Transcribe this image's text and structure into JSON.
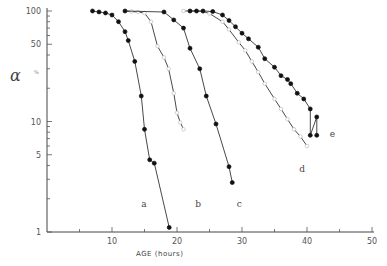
{
  "chart_data": {
    "type": "line",
    "title": "",
    "xlabel": "AGE (hours)",
    "ylabel": "α %",
    "y_scale": "log",
    "xlim": [
      0,
      50
    ],
    "ylim": [
      1,
      100
    ],
    "x_ticks": [
      10,
      20,
      30,
      40,
      50
    ],
    "y_tick_labels": [
      "1",
      "5",
      "10",
      "50",
      "100"
    ],
    "y_ticks": [
      1,
      5,
      10,
      50,
      100
    ],
    "grid": false,
    "legend": "none (curves labelled inline a–e)",
    "series": [
      {
        "name": "a",
        "marker": "filled-circle",
        "points": [
          [
            7,
            100
          ],
          [
            8,
            98
          ],
          [
            9,
            96
          ],
          [
            10,
            92
          ],
          [
            11,
            80
          ],
          [
            12,
            65
          ],
          [
            12.5,
            54
          ],
          [
            13.5,
            35
          ],
          [
            14.5,
            17
          ],
          [
            15,
            8.5
          ],
          [
            15.8,
            4.5
          ],
          [
            16.5,
            4.2
          ],
          [
            18.8,
            1.1
          ]
        ],
        "label_pos": [
          14.5,
          1.7
        ]
      },
      {
        "name": "b",
        "marker": "open-circle",
        "points": [
          [
            12,
            100
          ],
          [
            13,
            99
          ],
          [
            14,
            98
          ],
          [
            15,
            96
          ],
          [
            16,
            80
          ],
          [
            17,
            48
          ],
          [
            18,
            38
          ],
          [
            18.7,
            30
          ],
          [
            19.5,
            18
          ],
          [
            20,
            12
          ],
          [
            20.5,
            9.8
          ],
          [
            21,
            8.5
          ]
        ],
        "label_pos": [
          22.8,
          1.7
        ]
      },
      {
        "name": "c",
        "marker": "filled-circle",
        "points": [
          [
            12,
            100
          ],
          [
            18,
            98
          ],
          [
            19.5,
            83
          ],
          [
            21,
            70
          ],
          [
            22,
            46
          ],
          [
            23.5,
            30
          ],
          [
            24.5,
            17
          ],
          [
            26,
            9.5
          ],
          [
            28,
            3.9
          ],
          [
            28.5,
            2.8
          ]
        ],
        "label_pos": [
          29.2,
          1.7
        ]
      },
      {
        "name": "d",
        "marker": "open-circle",
        "points": [
          [
            21,
            100
          ],
          [
            22,
            100
          ],
          [
            23,
            100
          ],
          [
            24,
            99
          ],
          [
            25,
            95
          ],
          [
            27,
            80
          ],
          [
            28,
            68
          ],
          [
            29.5,
            52
          ],
          [
            30.5,
            44
          ],
          [
            31.5,
            35
          ],
          [
            32.5,
            28
          ],
          [
            33.5,
            22
          ],
          [
            35,
            16
          ],
          [
            36,
            13
          ],
          [
            37,
            10.5
          ],
          [
            38,
            8.5
          ],
          [
            39,
            7.3
          ],
          [
            40,
            6
          ]
        ],
        "label_pos": [
          38.8,
          3.5
        ]
      },
      {
        "name": "e",
        "marker": "filled-circle",
        "points": [
          [
            22,
            100
          ],
          [
            23,
            100
          ],
          [
            24,
            100
          ],
          [
            25.5,
            99
          ],
          [
            27,
            92
          ],
          [
            28,
            82
          ],
          [
            29,
            72
          ],
          [
            30,
            63
          ],
          [
            31,
            56
          ],
          [
            32.5,
            47
          ],
          [
            33.5,
            37
          ],
          [
            35,
            31
          ],
          [
            36,
            26
          ],
          [
            37,
            24
          ],
          [
            37.5,
            22
          ],
          [
            38.5,
            18
          ],
          [
            39.5,
            16
          ],
          [
            40.5,
            13
          ],
          [
            41.5,
            11
          ],
          [
            40.5,
            7.5
          ],
          [
            41.5,
            7.5
          ]
        ],
        "label_pos": [
          43.5,
          7.3
        ]
      }
    ]
  }
}
